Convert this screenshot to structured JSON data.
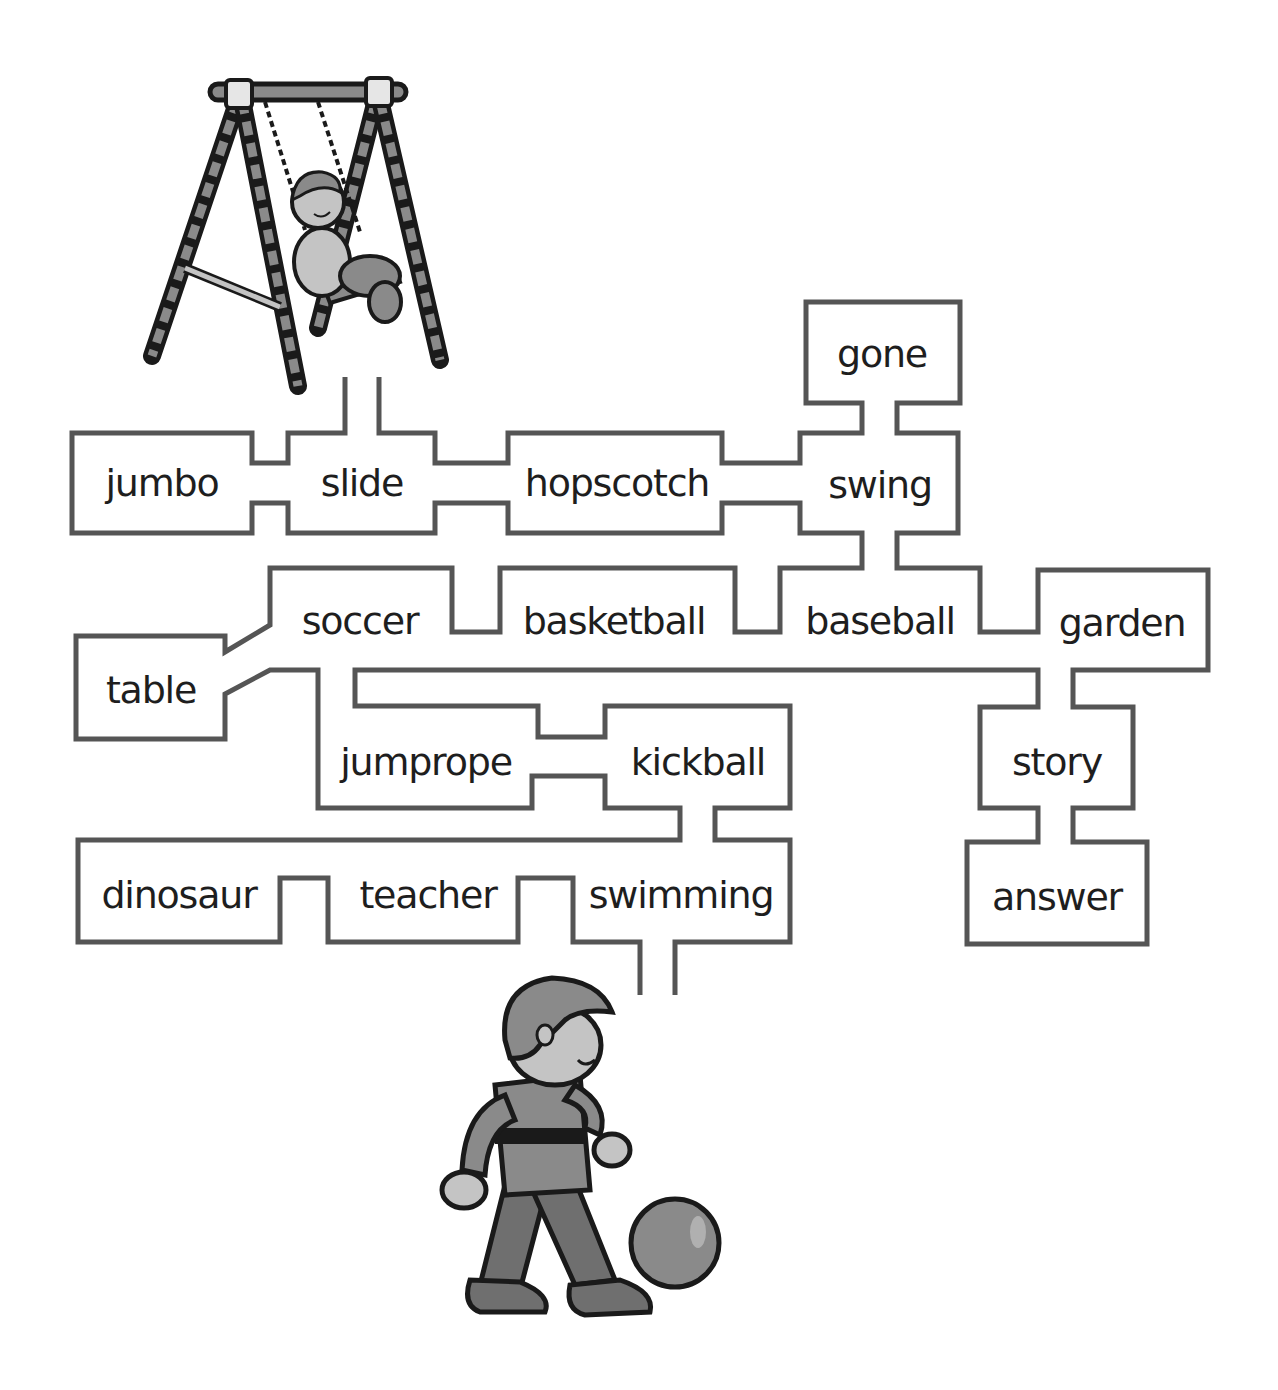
{
  "puzzle": {
    "type": "word maze",
    "start_picture": "child on a swing set",
    "end_picture": "boy kicking a ball"
  },
  "words": [
    {
      "id": "jumbo",
      "label": "jumbo",
      "x": 162,
      "y": 483
    },
    {
      "id": "slide",
      "label": "slide",
      "x": 362,
      "y": 483
    },
    {
      "id": "hopscotch",
      "label": "hopscotch",
      "x": 617,
      "y": 483
    },
    {
      "id": "gone",
      "label": "gone",
      "x": 882,
      "y": 354
    },
    {
      "id": "swing",
      "label": "swing",
      "x": 880,
      "y": 485
    },
    {
      "id": "soccer",
      "label": "soccer",
      "x": 360,
      "y": 621
    },
    {
      "id": "basketball",
      "label": "basketball",
      "x": 614,
      "y": 621
    },
    {
      "id": "baseball",
      "label": "baseball",
      "x": 880,
      "y": 621
    },
    {
      "id": "garden",
      "label": "garden",
      "x": 1122,
      "y": 623
    },
    {
      "id": "table",
      "label": "table",
      "x": 151,
      "y": 690
    },
    {
      "id": "jumprope",
      "label": "jumprope",
      "x": 426,
      "y": 762
    },
    {
      "id": "kickball",
      "label": "kickball",
      "x": 698,
      "y": 762
    },
    {
      "id": "story",
      "label": "story",
      "x": 1057,
      "y": 762
    },
    {
      "id": "dinosaur",
      "label": "dinosaur",
      "x": 179,
      "y": 895
    },
    {
      "id": "teacher",
      "label": "teacher",
      "x": 428,
      "y": 895
    },
    {
      "id": "swimming",
      "label": "swimming",
      "x": 681,
      "y": 895
    },
    {
      "id": "answer",
      "label": "answer",
      "x": 1057,
      "y": 897
    }
  ],
  "colors": {
    "wall": "#555555",
    "text": "#1e1e1e",
    "figure_dark": "#1a1a1a",
    "figure_mid": "#8a8a8a",
    "figure_light": "#c4c4c4",
    "background": "#ffffff"
  }
}
